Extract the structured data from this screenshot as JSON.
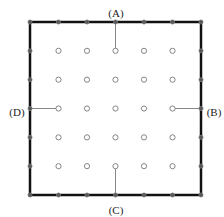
{
  "diagram": {
    "grid": {
      "cols": 7,
      "rows": 7,
      "x0": 30,
      "y0": 22,
      "x1": 201,
      "y1": 195,
      "border_color": "#111111",
      "point_color": "#777777",
      "lead_color": "#888888"
    },
    "labels": [
      {
        "id": "A",
        "text": "(A)",
        "x": 116,
        "y": 13
      },
      {
        "id": "B",
        "text": "(B)",
        "x": 214,
        "y": 112
      },
      {
        "id": "C",
        "text": "(C)",
        "x": 116,
        "y": 210
      },
      {
        "id": "D",
        "text": "(D)",
        "x": 17,
        "y": 112
      }
    ],
    "leads": [
      {
        "id": "A",
        "from": [
          3,
          0
        ],
        "to": [
          3,
          1
        ]
      },
      {
        "id": "B",
        "from": [
          6,
          3
        ],
        "to": [
          5,
          3
        ]
      },
      {
        "id": "C",
        "from": [
          3,
          6
        ],
        "to": [
          3,
          5
        ]
      },
      {
        "id": "D",
        "from": [
          0,
          3
        ],
        "to": [
          1,
          3
        ]
      }
    ]
  }
}
